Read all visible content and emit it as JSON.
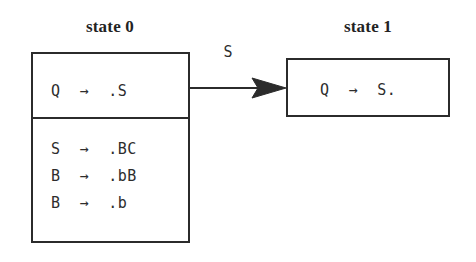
{
  "diagram": {
    "type": "lr-item-set-transition",
    "background_color": "#ffffff",
    "stroke_color": "#2b2b2b",
    "text_color": "#2d2d2d",
    "states": [
      {
        "caption": "state 0",
        "kernel_items": [
          {
            "text": "Q  →  .S"
          }
        ],
        "closure_items": [
          {
            "text": "S  →  .BC"
          },
          {
            "text": "B  →  .bB"
          },
          {
            "text": "B  →  .b"
          }
        ]
      },
      {
        "caption": "state 1",
        "kernel_items": [
          {
            "text": "Q  →  S."
          }
        ],
        "closure_items": []
      }
    ],
    "transitions": [
      {
        "label": "S",
        "from": "state 0",
        "to": "state 1"
      }
    ]
  }
}
